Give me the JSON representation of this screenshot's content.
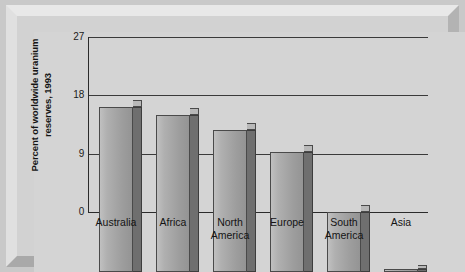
{
  "chart_data": {
    "type": "bar",
    "title": "",
    "subtitle": "",
    "xlabel": "",
    "ylabel": "Percent of worldwide uranium reserves, 1993",
    "ylabel_lines": [
      "Percent of worldwide uranium",
      "reserves, 1993"
    ],
    "categories": [
      "Australia",
      "Africa",
      "North America",
      "Europe",
      "South America",
      "Asia"
    ],
    "category_lines": [
      [
        "Australia"
      ],
      [
        "Africa"
      ],
      [
        "North",
        "America"
      ],
      [
        "Europe"
      ],
      [
        "South",
        "America"
      ],
      [
        "Asia"
      ]
    ],
    "values": [
      25.4,
      24.2,
      21.9,
      18.5,
      9.2,
      0.5
    ],
    "ylim": [
      0,
      27
    ],
    "yticks": [
      0,
      9,
      18,
      27
    ],
    "ytick_labels": [
      "0",
      "9",
      "18",
      "27"
    ],
    "grid": "horizontal",
    "legend": "none",
    "style": "3d-bar",
    "colors": {
      "bar_front": "#adadad",
      "bar_side": "#6f6f6f",
      "bar_top": "#b8b8b8",
      "bar_outline": "#4a4a4a",
      "plot_background": "#d4d4d4",
      "frame_background": "#c9c9c9",
      "gridline": "#3a3a3a",
      "text": "#141414"
    }
  }
}
